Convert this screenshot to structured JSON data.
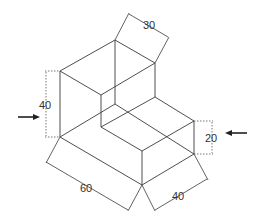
{
  "diagram": {
    "type": "isometric-drawing",
    "dimensions": {
      "top_depth": "30",
      "left_height": "40",
      "right_step_height": "20",
      "front_left_length": "60",
      "front_right_width": "40"
    },
    "arrows": [
      {
        "name": "left-view-arrow",
        "direction": "right"
      },
      {
        "name": "right-view-arrow",
        "direction": "left"
      }
    ],
    "colors": {
      "line": "#3a3a3a",
      "background": "#ffffff"
    }
  }
}
